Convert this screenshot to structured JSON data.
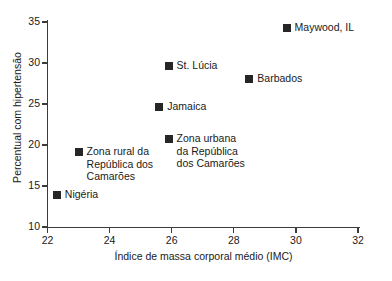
{
  "chart_data": {
    "type": "scatter",
    "title": "",
    "subtitle": "",
    "xlabel": "Índice de massa corporal médio (IMC)",
    "ylabel": "Percentual com hipertensão",
    "xlim": [
      22,
      32
    ],
    "ylim": [
      10,
      35
    ],
    "xticks": [
      22,
      24,
      26,
      28,
      30,
      32
    ],
    "yticks": [
      10,
      15,
      20,
      25,
      30,
      35
    ],
    "grid": false,
    "legend": "none (points labeled inline)",
    "marker_color": "#262626",
    "axis_color": "#3c3c3c",
    "points": [
      {
        "label": "Maywood, IL",
        "label_lines": [
          "Maywood, IL"
        ],
        "x": 29.7,
        "y": 34.3,
        "label_side": "right"
      },
      {
        "label": "St. Lúcia",
        "label_lines": [
          "St. Lúcia"
        ],
        "x": 25.9,
        "y": 29.6,
        "label_side": "right"
      },
      {
        "label": "Barbados",
        "label_lines": [
          "Barbados"
        ],
        "x": 28.5,
        "y": 28.0,
        "label_side": "right"
      },
      {
        "label": "Jamaica",
        "label_lines": [
          "Jamaica"
        ],
        "x": 25.6,
        "y": 24.6,
        "label_side": "right"
      },
      {
        "label": "Zona urbana da República dos Camarões",
        "label_lines": [
          "Zona urbana",
          "da República",
          "dos Camarões"
        ],
        "x": 25.9,
        "y": 20.7,
        "label_side": "right"
      },
      {
        "label": "Zona rural da República dos Camarões",
        "label_lines": [
          "Zona rural da",
          "República dos",
          "Camarões"
        ],
        "x": 23.0,
        "y": 19.1,
        "label_side": "right"
      },
      {
        "label": "Nigéria",
        "label_lines": [
          "Nigéria"
        ],
        "x": 22.3,
        "y": 13.9,
        "label_side": "right"
      }
    ]
  },
  "axis": {
    "x_tick_labels": [
      "22",
      "24",
      "26",
      "28",
      "30",
      "32"
    ],
    "y_tick_labels": [
      "10",
      "15",
      "20",
      "25",
      "30",
      "35"
    ],
    "x_title": "Índice de massa corporal médio (IMC)",
    "y_title": "Percentual com hipertensão"
  }
}
